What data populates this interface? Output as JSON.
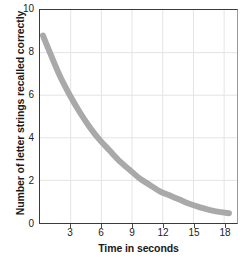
{
  "chart_data": {
    "type": "line",
    "title": "",
    "xlabel": "Time in seconds",
    "ylabel": "Number of letter strings recalled correctly",
    "xlim": [
      0,
      19.8
    ],
    "ylim": [
      0,
      10
    ],
    "grid": true,
    "legend": "none",
    "line_color": "#a9a9a9",
    "line_width": 6,
    "xticks": [
      3,
      6,
      9,
      12,
      15,
      18
    ],
    "yticks": [
      0,
      2,
      4,
      6,
      8,
      10
    ],
    "series": [
      {
        "name": "Letter strings recalled",
        "x": [
          0.3,
          1,
          2,
          3,
          4,
          5,
          6,
          7,
          8,
          9,
          10,
          11,
          12,
          13,
          14,
          15,
          16,
          17,
          18,
          19
        ],
        "values": [
          8.8,
          8.0,
          6.9,
          6.0,
          5.2,
          4.5,
          3.9,
          3.4,
          2.9,
          2.5,
          2.1,
          1.8,
          1.5,
          1.3,
          1.1,
          0.9,
          0.75,
          0.62,
          0.52,
          0.46
        ]
      }
    ]
  },
  "axes": {
    "y_title": "Number of letter strings recalled correctly",
    "x_title": "Time in seconds",
    "y_tick_labels": [
      "10",
      "8",
      "6",
      "4",
      "2",
      "0"
    ],
    "x_tick_labels": [
      "3",
      "6",
      "9",
      "12",
      "15",
      "18"
    ]
  },
  "colors": {
    "curve": "#a9a9a9",
    "grid": "#e2e2e2",
    "axis": "#3a3a3a",
    "text": "#1a1a1a"
  }
}
